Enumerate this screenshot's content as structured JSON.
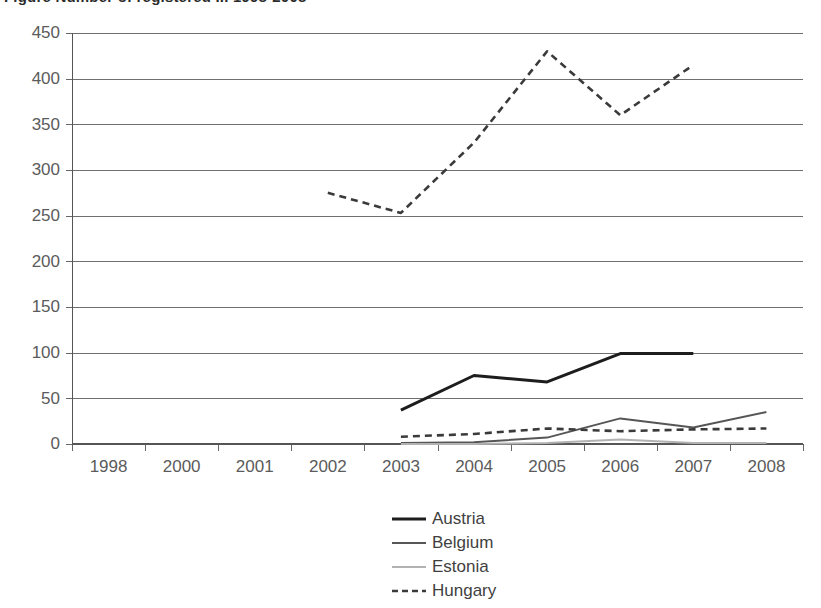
{
  "figure": {
    "title_fragment": "Figure  Number of registered ... 1998-2008",
    "title_visible": false
  },
  "chart_data": {
    "type": "line",
    "title": "",
    "xlabel": "",
    "ylabel": "",
    "categories": [
      "1998",
      "2000",
      "2001",
      "2002",
      "2003",
      "2004",
      "2005",
      "2006",
      "2007",
      "2008"
    ],
    "ylim": [
      0,
      450
    ],
    "yticks": [
      0,
      50,
      100,
      150,
      200,
      250,
      300,
      350,
      400,
      450
    ],
    "grid": "horizontal",
    "legend_position": "bottom-center",
    "series": [
      {
        "name": "Austria",
        "color": "#1d1d1d",
        "style": "solid",
        "width": 3,
        "values": [
          null,
          null,
          null,
          null,
          37,
          75,
          68,
          99,
          99,
          null
        ]
      },
      {
        "name": "Belgium",
        "color": "#565656",
        "style": "solid",
        "width": 2,
        "values": [
          null,
          null,
          null,
          null,
          1,
          2,
          7,
          28,
          18,
          35
        ]
      },
      {
        "name": "Estonia",
        "color": "#b2b2b2",
        "style": "solid",
        "width": 2,
        "values": [
          null,
          null,
          null,
          null,
          0,
          0,
          1,
          5,
          1,
          1
        ]
      },
      {
        "name": "Hungary",
        "color": "#3a3a3a",
        "style": "dashed",
        "width": 2.6,
        "values": [
          null,
          null,
          null,
          275,
          253,
          330,
          430,
          360,
          415,
          null
        ]
      }
    ],
    "hungary_extra_points": {
      "note": "Hungary also tracks a low secondary dashed line near the baseline",
      "values": [
        null,
        null,
        null,
        null,
        8,
        11,
        17,
        14,
        16,
        17
      ]
    }
  },
  "legend": {
    "items": [
      {
        "label": "Austria"
      },
      {
        "label": "Belgium"
      },
      {
        "label": "Estonia"
      },
      {
        "label": "Hungary"
      }
    ]
  },
  "axis": {
    "y_tick_labels": [
      "450",
      "400",
      "350",
      "300",
      "250",
      "200",
      "150",
      "100",
      "50",
      "0"
    ],
    "x_tick_labels": [
      "1998",
      "2000",
      "2001",
      "2002",
      "2003",
      "2004",
      "2005",
      "2006",
      "2007",
      "2008"
    ]
  }
}
